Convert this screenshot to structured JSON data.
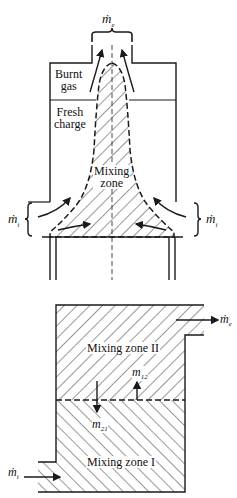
{
  "top_diagram": {
    "exhaust_flow_label": "ṁ",
    "exhaust_flow_sub": "e",
    "burnt_gas_label": [
      "Burnt",
      "gas"
    ],
    "fresh_charge_label": [
      "Fresh",
      "charge"
    ],
    "mixing_zone_label": [
      "Mixing",
      "zone"
    ],
    "intake_left_label": "ṁ",
    "intake_left_sub": "i",
    "intake_right_label": "ṁ",
    "intake_right_sub": "i"
  },
  "bottom_diagram": {
    "zone_upper_label": "Mixing zone II",
    "zone_lower_label": "Mixing zone I",
    "transfer_up_label": "m",
    "transfer_up_sub": "12",
    "transfer_down_label": "m",
    "transfer_down_sub": "21",
    "exhaust_flow_label": "ṁ",
    "exhaust_flow_sub": "e",
    "intake_flow_label": "ṁ",
    "intake_flow_sub": "i"
  },
  "colors": {
    "line": "#1a1a1a",
    "background": "#ffffff"
  }
}
